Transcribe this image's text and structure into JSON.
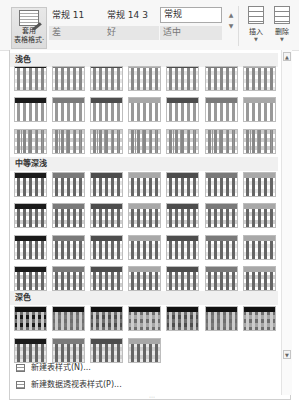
{
  "ribbon": {
    "format_as_table": {
      "label_line1": "套用",
      "label_line2": "表格格式·",
      "icon": "format-table-icon"
    },
    "cell_styles": [
      {
        "label": "常规 11",
        "style": "plain"
      },
      {
        "label": "常规 14 3",
        "style": "plain"
      },
      {
        "label": "常规",
        "style": "boxed"
      },
      {
        "label": "差",
        "style": "shaded"
      },
      {
        "label": "好",
        "style": "shaded"
      },
      {
        "label": "适中",
        "style": "shaded"
      }
    ],
    "scroll_up": "▲",
    "scroll_more": "▼",
    "insert": {
      "label": "插入",
      "arrow": "▼",
      "icon": "insert-cells-icon"
    },
    "delete": {
      "label": "删除",
      "arrow": "▼",
      "icon": "delete-cells-icon"
    }
  },
  "gallery": {
    "groups": [
      {
        "name": "浅色",
        "rows": 3,
        "count": 21
      },
      {
        "name": "中等深浅",
        "rows": 4,
        "count": 28
      },
      {
        "name": "深色",
        "rows": 2,
        "count": 11
      }
    ],
    "scroll_up_glyph": "▲",
    "scroll_down_glyph": "▼",
    "resize_grip": "⋯"
  },
  "menu": [
    {
      "label": "新建表样式(N)...",
      "icon": "new-table-style-icon"
    },
    {
      "label": "新建数据透视表样式(P)...",
      "icon": "new-pivot-style-icon"
    }
  ],
  "colors": {
    "header_black": "#1a1a1a",
    "header_dark_gray": "#4d4d4d",
    "header_mid_gray": "#7a7a7a",
    "header_light_gray": "#a8a8a8",
    "band_light": "#e6e6e6",
    "band_mid": "#cfcfcf",
    "band_dark": "#6e6e6e"
  }
}
